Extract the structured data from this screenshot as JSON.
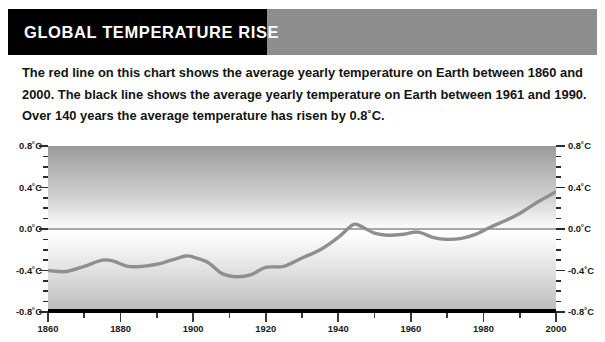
{
  "header": {
    "title": "GLOBAL TEMPERATURE RISE",
    "band_color": "#8e8e8e",
    "box_color": "#000000",
    "title_color": "#ffffff"
  },
  "intro": {
    "line1": "The red line on this chart shows the average yearly temperature on Earth between 1860 and",
    "line2": "2000. The black line shows the average yearly temperature on Earth between 1961 and 1990.",
    "line3": "Over 140 years the average temperature has risen by 0.8˚C."
  },
  "chart_data": {
    "type": "line",
    "title": "GLOBAL TEMPERATURE RISE",
    "xlabel": "",
    "ylabel": "",
    "xlim": [
      1860,
      2000
    ],
    "ylim": [
      -0.8,
      0.8
    ],
    "grid": false,
    "legend": "none",
    "zero_line": 0.0,
    "zero_line_color": "#555555",
    "line_color": "#8f8f8f",
    "x_ticks_major": [
      1860,
      1880,
      1900,
      1920,
      1940,
      1960,
      1980,
      2000
    ],
    "x_ticks_minor": [
      1870,
      1890,
      1910,
      1930,
      1950,
      1970,
      1990
    ],
    "x_tick_labels": [
      "1860",
      "1880",
      "1900",
      "1920",
      "1940",
      "1960",
      "1980",
      "2000"
    ],
    "y_ticks_major": [
      0.8,
      0.4,
      0.0,
      -0.4,
      -0.8
    ],
    "y_ticks_minor": [
      0.7,
      0.6,
      0.5,
      0.3,
      0.2,
      0.1,
      -0.1,
      -0.2,
      -0.3,
      -0.5,
      -0.6,
      -0.7
    ],
    "y_tick_labels": [
      "0.8˚C",
      "0.4˚C",
      "0.0˚C",
      "-0.4˚C",
      "-0.8˚C"
    ],
    "series": [
      {
        "name": "Average yearly temperature on Earth",
        "color": "#8f8f8f",
        "x": [
          1860,
          1865,
          1870,
          1875,
          1878,
          1882,
          1886,
          1890,
          1894,
          1898,
          1900,
          1904,
          1908,
          1912,
          1916,
          1920,
          1925,
          1930,
          1935,
          1940,
          1944,
          1946,
          1950,
          1954,
          1958,
          1962,
          1966,
          1970,
          1974,
          1978,
          1982,
          1986,
          1990,
          1994,
          1997,
          2000
        ],
        "y": [
          -0.4,
          -0.41,
          -0.36,
          -0.3,
          -0.31,
          -0.36,
          -0.36,
          -0.34,
          -0.3,
          -0.26,
          -0.27,
          -0.32,
          -0.43,
          -0.46,
          -0.44,
          -0.37,
          -0.36,
          -0.28,
          -0.2,
          -0.08,
          0.04,
          0.03,
          -0.04,
          -0.06,
          -0.05,
          -0.03,
          -0.08,
          -0.1,
          -0.09,
          -0.05,
          0.02,
          0.08,
          0.15,
          0.24,
          0.3,
          0.36
        ]
      }
    ]
  }
}
